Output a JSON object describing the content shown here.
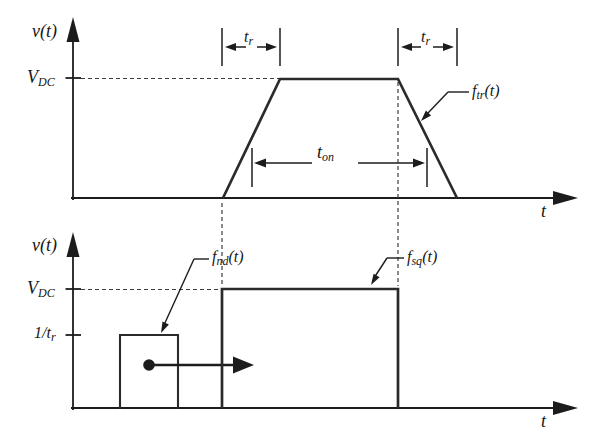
{
  "colors": {
    "ink": "#1c1c1c",
    "background": "#ffffff"
  },
  "top_plot": {
    "y_axis_label": "v(t)",
    "x_axis_label": "t",
    "v_dc_label": {
      "main": "V",
      "sub": "DC"
    },
    "t_r_left_label": {
      "main": "t",
      "sub": "r"
    },
    "t_r_right_label": {
      "main": "t",
      "sub": "r"
    },
    "t_on_label": {
      "main": "t",
      "sub": "on"
    },
    "f_tr_label": {
      "main": "f",
      "sub": "tr",
      "suffix": "(t)"
    },
    "trapezoid_points": "223,198 280,79 398,79 457,198"
  },
  "bottom_plot": {
    "y_axis_label": "v(t)",
    "x_axis_label": "t",
    "v_dc_label": {
      "main": "V",
      "sub": "DC"
    },
    "inv_tr_label": {
      "main": "1/t",
      "sub": "r"
    },
    "f_nd_label": {
      "main": "f",
      "sub": "nd",
      "suffix": "(t)"
    },
    "f_sq_label": {
      "main": "f",
      "sub": "sq",
      "suffix": "(t)"
    },
    "square_pulse_points": "222,408 222,289 398,289 398,408",
    "nd_pulse_points": "120,409 120,335 178,335 178,409"
  }
}
